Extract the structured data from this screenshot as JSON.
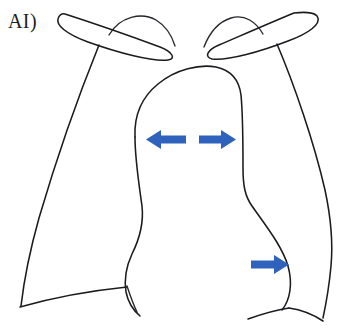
{
  "figure": {
    "panel_label": "AI)",
    "title": "Chest radiograph schematic with directional arrows",
    "background_color": "#ffffff",
    "line_color": "#1b1b1f",
    "arrow_color": "#2f62bd"
  },
  "anatomy": {
    "parts": [
      {
        "name": "left-clavicle",
        "label": "Left clavicle"
      },
      {
        "name": "right-clavicle",
        "label": "Right clavicle"
      },
      {
        "name": "left-lung-apex",
        "label": "Left lung apex"
      },
      {
        "name": "right-lung-apex",
        "label": "Right lung apex"
      },
      {
        "name": "left-lung-border",
        "label": "Left lateral chest wall"
      },
      {
        "name": "right-lung-border",
        "label": "Right lateral chest wall"
      },
      {
        "name": "mediastinum",
        "label": "Mediastinal / cardiac silhouette"
      },
      {
        "name": "left-hemidiaphragm",
        "label": "Left hemidiaphragm"
      },
      {
        "name": "right-hemidiaphragm",
        "label": "Right hemidiaphragm"
      }
    ]
  },
  "arrows": [
    {
      "name": "arrow-mediastinum-left",
      "direction": "left",
      "color": "#2f62bd",
      "x": 146,
      "y": 130,
      "width": 40,
      "height": 19
    },
    {
      "name": "arrow-mediastinum-right",
      "direction": "right",
      "color": "#2f62bd",
      "x": 199,
      "y": 130,
      "width": 37,
      "height": 19
    },
    {
      "name": "arrow-cardiac-border-right",
      "direction": "right",
      "color": "#2f62bd",
      "x": 251,
      "y": 255,
      "width": 38,
      "height": 19
    }
  ]
}
